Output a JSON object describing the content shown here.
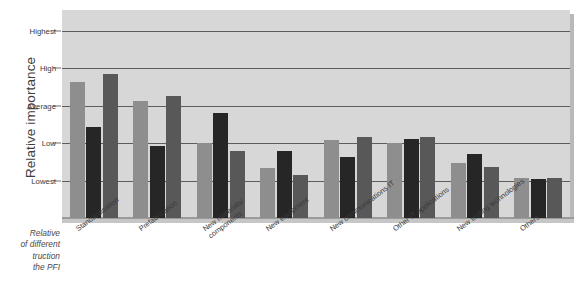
{
  "figure": {
    "yaxis_title": "Relative importance",
    "caption_lines": [
      "Relative",
      "of different",
      "truction",
      "the PFI"
    ]
  },
  "chart_data": {
    "type": "bar",
    "title": "",
    "xlabel": "",
    "ylabel": "Relative importance",
    "grid": true,
    "legend": "none",
    "ytick_labels": [
      "Highest",
      "High",
      "Average",
      "Low",
      "Lowest"
    ],
    "ytick_values": [
      5,
      4,
      3,
      2,
      1
    ],
    "ylim": [
      0,
      5.55
    ],
    "categories": [
      "Standardisation",
      "Prefabrication",
      "New materials/components",
      "New equipment",
      "New communications IT",
      "Other IT applications",
      "New testing technologies",
      "Others"
    ],
    "categories_wrapped": [
      [
        "Standardisation"
      ],
      [
        "Prefabrication"
      ],
      [
        "New materials/",
        "components"
      ],
      [
        "New equipment"
      ],
      [
        "New communications IT"
      ],
      [
        "Other IT applications"
      ],
      [
        "New testing technologies"
      ],
      [
        "Others"
      ]
    ],
    "series": [
      {
        "name": "Series 1",
        "color": "#8e8e8e",
        "values": [
          3.62,
          3.12,
          2.0,
          1.33,
          2.07,
          2.0,
          1.47,
          1.08
        ]
      },
      {
        "name": "Series 2",
        "color": "#262626",
        "values": [
          2.42,
          1.92,
          2.8,
          1.78,
          1.62,
          2.1,
          1.7,
          1.05
        ]
      },
      {
        "name": "Series 3",
        "color": "#585858",
        "values": [
          3.85,
          3.26,
          1.8,
          1.16,
          2.15,
          2.16,
          1.36,
          1.07
        ]
      }
    ]
  }
}
